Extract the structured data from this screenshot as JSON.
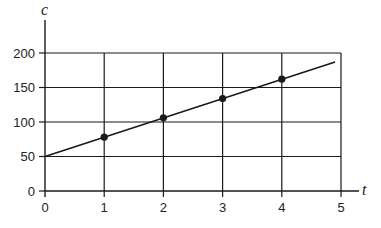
{
  "chart_data": {
    "type": "line",
    "title": "",
    "xlabel": "t",
    "ylabel": "c",
    "x": [
      1,
      2,
      3,
      4
    ],
    "series": [
      {
        "name": "c = 50 + 28t",
        "markers": [
          {
            "t": 1,
            "c": 78
          },
          {
            "t": 2,
            "c": 106
          },
          {
            "t": 3,
            "c": 134
          },
          {
            "t": 4,
            "c": 162
          }
        ],
        "line": {
          "start": {
            "t": 0,
            "c": 50
          },
          "end": {
            "t": 4.9,
            "c": 187
          }
        }
      }
    ],
    "xticks": [
      "0",
      "1",
      "2",
      "3",
      "4",
      "5"
    ],
    "yticks": [
      "0",
      "50",
      "100",
      "150",
      "200"
    ],
    "xlim": [
      0,
      5
    ],
    "ylim": [
      0,
      200
    ],
    "grid": true,
    "legend": null
  },
  "colors": {
    "line": "#1a1a1a",
    "grid": "#1a1a1a",
    "text": "#222222",
    "background": "#ffffff"
  }
}
